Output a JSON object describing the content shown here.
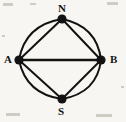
{
  "figure": {
    "kind": "multigraph-diagram",
    "width": 126,
    "height": 122,
    "background_color": "#f7f6f2",
    "ink_color": "#121212",
    "title": ""
  },
  "nodes": [
    {
      "id": "N",
      "label": "N",
      "x": 62,
      "y": 19,
      "radius": 4.6,
      "label_x": 58,
      "label_y": 3,
      "label_position": "above"
    },
    {
      "id": "A",
      "label": "A",
      "x": 19,
      "y": 60,
      "radius": 4.6,
      "label_x": 4,
      "label_y": 54,
      "label_position": "left"
    },
    {
      "id": "B",
      "label": "B",
      "x": 101,
      "y": 60,
      "radius": 4.6,
      "label_x": 110,
      "label_y": 54,
      "label_position": "right"
    },
    {
      "id": "S",
      "label": "S",
      "x": 62,
      "y": 99,
      "radius": 4.6,
      "label_x": 58,
      "label_y": 106,
      "label_position": "below"
    }
  ],
  "edges": [
    {
      "id": "A-N-chord",
      "from": "A",
      "to": "N",
      "style": "chord",
      "bulge": 0,
      "stroke_width": 2.0
    },
    {
      "id": "A-N-arc",
      "from": "A",
      "to": "N",
      "style": "outer-arc",
      "bulge": 11,
      "stroke_width": 2.0
    },
    {
      "id": "N-B-chord",
      "from": "N",
      "to": "B",
      "style": "chord",
      "bulge": 0,
      "stroke_width": 2.0
    },
    {
      "id": "N-B-arc",
      "from": "N",
      "to": "B",
      "style": "outer-arc",
      "bulge": 11,
      "stroke_width": 2.0
    },
    {
      "id": "A-S-chord",
      "from": "A",
      "to": "S",
      "style": "chord",
      "bulge": 0,
      "stroke_width": 2.0
    },
    {
      "id": "A-S-arc",
      "from": "A",
      "to": "S",
      "style": "outer-arc",
      "bulge": 11,
      "stroke_width": 2.0
    },
    {
      "id": "S-B-chord",
      "from": "S",
      "to": "B",
      "style": "chord",
      "bulge": 0,
      "stroke_width": 2.0
    },
    {
      "id": "S-B-arc",
      "from": "S",
      "to": "B",
      "style": "outer-arc",
      "bulge": 11,
      "stroke_width": 2.0
    },
    {
      "id": "A-B-straight",
      "from": "A",
      "to": "B",
      "style": "straight",
      "bulge": 0,
      "stroke_width": 2.4
    }
  ],
  "edge_paths": {
    "A-N-chord": "M 19 60 L 62 19",
    "A-N-arc": "M 19 60 Q 25 25 62 19",
    "N-B-chord": "M 62 19 L 101 60",
    "N-B-arc": "M 62 19 Q 97 26 101 60",
    "A-S-chord": "M 19 60 L 62 99",
    "A-S-arc": "M 19 60 Q 26 94 62 99",
    "S-B-chord": "M 62 99 L 101 60",
    "S-B-arc": "M 62 99 Q 97 93 101 60",
    "A-B-straight": "M 19 60 L 101 60"
  },
  "specks": [
    {
      "x": 3,
      "y": 3,
      "w": 10,
      "h": 3
    },
    {
      "x": 107,
      "y": 2,
      "w": 11,
      "h": 3
    },
    {
      "x": 30,
      "y": 3,
      "w": 6,
      "h": 2
    },
    {
      "x": 6,
      "y": 113,
      "w": 14,
      "h": 3
    },
    {
      "x": 96,
      "y": 114,
      "w": 16,
      "h": 3
    },
    {
      "x": 2,
      "y": 35,
      "w": 3,
      "h": 2
    },
    {
      "x": 121,
      "y": 86,
      "w": 3,
      "h": 2
    }
  ]
}
